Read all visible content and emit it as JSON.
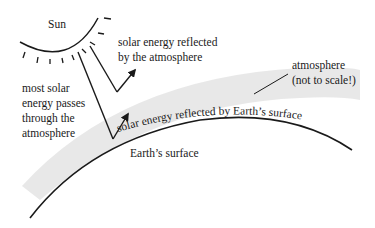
{
  "diagram": {
    "type": "solar-energy-atmosphere",
    "labels": {
      "sun": "Sun",
      "reflected_atmosphere_line1": "solar energy reflected",
      "reflected_atmosphere_line2": "by the atmosphere",
      "atmosphere_line1": "atmosphere",
      "atmosphere_line2": "(not to scale!)",
      "passes_line1": "most solar",
      "passes_line2": "energy passes",
      "passes_line3": "through the",
      "passes_line4": "atmosphere",
      "reflected_surface": "solar energy reflected by Earth’s surface",
      "earth_surface": "Earth’s surface"
    },
    "colors": {
      "ink": "#1a1a1a",
      "atmosphere_band": "#e6e6e6",
      "background": "#ffffff"
    }
  }
}
